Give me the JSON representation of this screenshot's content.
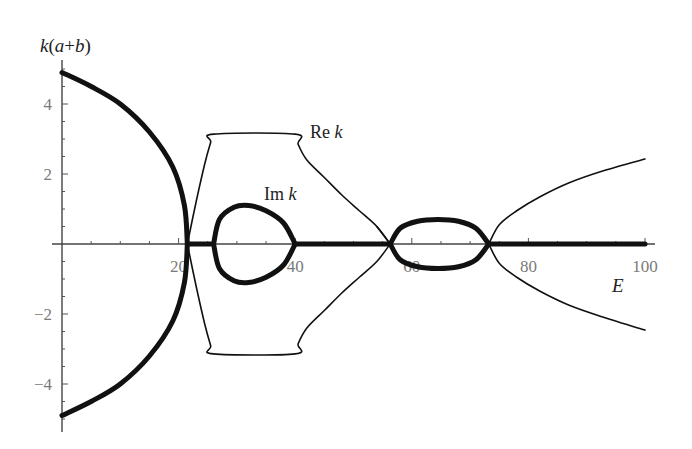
{
  "chart_data": {
    "type": "line",
    "title": "",
    "xlabel": "E",
    "ylabel": "k(a+b)",
    "xlim": [
      0,
      100
    ],
    "ylim": [
      -5.2,
      5.2
    ],
    "grid": false,
    "legend": "inline labels",
    "x_ticks": [
      20,
      40,
      60,
      80,
      100
    ],
    "y_ticks": [
      -4,
      -2,
      2,
      4
    ],
    "x_tick_labels": [
      "20",
      "40",
      "60",
      "80",
      "100"
    ],
    "y_tick_labels": [
      "−4",
      "−2",
      "2",
      "4"
    ],
    "annotations": [
      {
        "text": "Re k",
        "x": 43,
        "y": 3.3
      },
      {
        "text": "Im k",
        "x": 35,
        "y": 1.25
      }
    ],
    "series": [
      {
        "name": "Im k",
        "style": "thick",
        "note": "nonzero in band gaps; zero (on axis) elsewhere",
        "segments": [
          {
            "label": "gap 1 upper",
            "points": [
              [
                0,
                4.9
              ],
              [
                5,
                4.5
              ],
              [
                10,
                4.0
              ],
              [
                15,
                3.2
              ],
              [
                19,
                2.2
              ],
              [
                21,
                1.1
              ],
              [
                21.5,
                0
              ]
            ]
          },
          {
            "label": "gap 1 lower",
            "points": [
              [
                0,
                -4.9
              ],
              [
                5,
                -4.5
              ],
              [
                10,
                -4.0
              ],
              [
                15,
                -3.2
              ],
              [
                19,
                -2.2
              ],
              [
                21,
                -1.1
              ],
              [
                21.5,
                0
              ]
            ]
          },
          {
            "label": "zero band 1",
            "points": [
              [
                21.5,
                0
              ],
              [
                26,
                0
              ]
            ]
          },
          {
            "label": "gap 2 loop upper",
            "points": [
              [
                26,
                0
              ],
              [
                27,
                0.7
              ],
              [
                29.5,
                1.05
              ],
              [
                32,
                1.1
              ],
              [
                35,
                0.95
              ],
              [
                38,
                0.6
              ],
              [
                40,
                0
              ]
            ]
          },
          {
            "label": "gap 2 loop lower",
            "points": [
              [
                26,
                0
              ],
              [
                27,
                -0.7
              ],
              [
                29.5,
                -1.05
              ],
              [
                32,
                -1.1
              ],
              [
                35,
                -0.95
              ],
              [
                38,
                -0.6
              ],
              [
                40,
                0
              ]
            ]
          },
          {
            "label": "zero band 2",
            "points": [
              [
                40,
                0
              ],
              [
                56.3,
                0
              ]
            ]
          },
          {
            "label": "gap 3 loop upper",
            "points": [
              [
                56.3,
                0
              ],
              [
                58,
                0.45
              ],
              [
                61,
                0.65
              ],
              [
                64.5,
                0.7
              ],
              [
                68,
                0.65
              ],
              [
                71,
                0.45
              ],
              [
                73.2,
                0
              ]
            ]
          },
          {
            "label": "gap 3 loop lower",
            "points": [
              [
                56.3,
                0
              ],
              [
                58,
                -0.45
              ],
              [
                61,
                -0.65
              ],
              [
                64.5,
                -0.7
              ],
              [
                68,
                -0.65
              ],
              [
                71,
                -0.45
              ],
              [
                73.2,
                0
              ]
            ]
          },
          {
            "label": "zero band 3",
            "points": [
              [
                73.2,
                0
              ],
              [
                100,
                0
              ]
            ]
          }
        ]
      },
      {
        "name": "Re k",
        "style": "thin",
        "segments": [
          {
            "label": "band 1 upper",
            "points": [
              [
                21.5,
                0
              ],
              [
                23,
                1.2
              ],
              [
                24.5,
                2.3
              ],
              [
                25.5,
                2.9
              ],
              [
                26,
                3.14
              ],
              [
                40,
                3.14
              ],
              [
                40.5,
                2.85
              ],
              [
                42,
                2.4
              ],
              [
                45,
                1.9
              ],
              [
                48,
                1.4
              ],
              [
                51,
                0.95
              ],
              [
                54,
                0.5
              ],
              [
                56.3,
                0
              ]
            ]
          },
          {
            "label": "band 1 lower",
            "points": [
              [
                21.5,
                0
              ],
              [
                23,
                -1.2
              ],
              [
                24.5,
                -2.3
              ],
              [
                25.5,
                -2.9
              ],
              [
                26,
                -3.14
              ],
              [
                40,
                -3.14
              ],
              [
                40.5,
                -2.85
              ],
              [
                42,
                -2.4
              ],
              [
                45,
                -1.9
              ],
              [
                48,
                -1.4
              ],
              [
                51,
                -0.95
              ],
              [
                54,
                -0.5
              ],
              [
                56.3,
                0
              ]
            ]
          },
          {
            "label": "band 2 upper",
            "points": [
              [
                56.3,
                0
              ],
              [
                54,
                0.5
              ]
            ]
          },
          {
            "label": "band 3 upper",
            "points": [
              [
                73.2,
                0
              ],
              [
                75,
                0.55
              ],
              [
                78,
                0.95
              ],
              [
                82,
                1.35
              ],
              [
                87,
                1.75
              ],
              [
                93,
                2.1
              ],
              [
                100,
                2.43
              ]
            ]
          },
          {
            "label": "band 3 lower",
            "points": [
              [
                73.2,
                0
              ],
              [
                75,
                -0.55
              ],
              [
                78,
                -0.95
              ],
              [
                82,
                -1.35
              ],
              [
                87,
                -1.75
              ],
              [
                93,
                -2.1
              ],
              [
                100,
                -2.46
              ]
            ]
          }
        ]
      }
    ]
  }
}
